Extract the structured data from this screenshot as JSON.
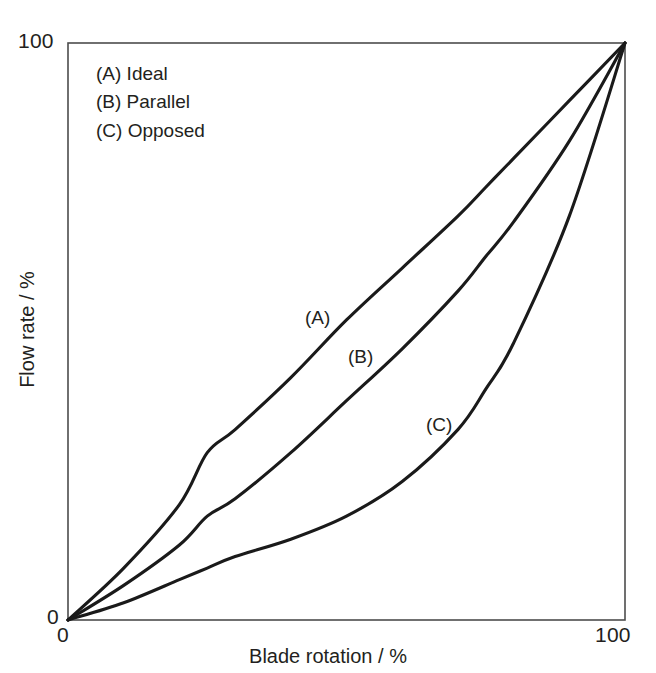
{
  "chart_data": {
    "type": "line",
    "title": "",
    "subtitle": "",
    "xlabel": "Blade rotation / %",
    "ylabel": "Flow rate / %",
    "xlim": [
      0,
      100
    ],
    "ylim": [
      0,
      100
    ],
    "xticks": [
      "0",
      "100"
    ],
    "yticks": [
      "0",
      "100"
    ],
    "grid": false,
    "legend_position": "top-left inside axes",
    "series": [
      {
        "name": "(A) Ideal",
        "key": "A",
        "annotation": "(A)",
        "x": [
          0,
          10,
          20,
          25,
          30,
          40,
          50,
          60,
          70,
          75,
          80,
          90,
          100
        ],
        "values": [
          0,
          9,
          20,
          29,
          33,
          42,
          52,
          61,
          70,
          75,
          80,
          90,
          100
        ]
      },
      {
        "name": "(B) Parallel",
        "key": "B",
        "annotation": "(B)",
        "x": [
          0,
          10,
          20,
          25,
          30,
          40,
          50,
          60,
          70,
          75,
          80,
          90,
          100
        ],
        "values": [
          0,
          6,
          13,
          18,
          21,
          29,
          38,
          47,
          57,
          63,
          69,
          83,
          100
        ]
      },
      {
        "name": "(C) Opposed",
        "key": "C",
        "annotation": "(C)",
        "x": [
          0,
          10,
          20,
          25,
          30,
          40,
          50,
          60,
          70,
          75,
          80,
          90,
          100
        ],
        "values": [
          0,
          3,
          7,
          9,
          11,
          14,
          18,
          24,
          33,
          40,
          48,
          70,
          100
        ]
      }
    ]
  },
  "axes": {
    "x_title": "Blade rotation / %",
    "y_title": "Flow rate / %",
    "x_tick_min": "0",
    "x_tick_max": "100",
    "y_tick_min": "0",
    "y_tick_max": "100"
  },
  "legend": {
    "entries": [
      {
        "label": "(A) Ideal"
      },
      {
        "label": "(B) Parallel"
      },
      {
        "label": "(C) Opposed"
      }
    ]
  },
  "annotations": [
    {
      "label": "(A)"
    },
    {
      "label": "(B)"
    },
    {
      "label": "(C)"
    }
  ],
  "colors": {
    "background": "#ffffff",
    "curve": "#1a1a1a",
    "axis": "#555555",
    "text": "#231f20"
  }
}
